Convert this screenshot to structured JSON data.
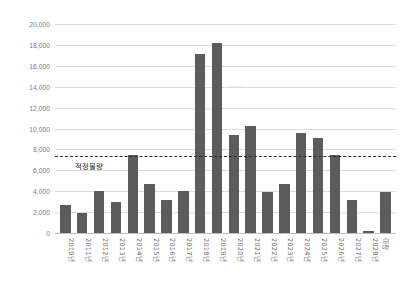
{
  "chart_data": {
    "type": "bar",
    "title": "",
    "subtitle": "",
    "xlabel": "",
    "ylabel": "",
    "ylim": [
      0,
      20000
    ],
    "ytick_step": 2000,
    "yticks": [
      "0",
      "2,000",
      "4,000",
      "6,000",
      "8,000",
      "10,000",
      "12,000",
      "14,000",
      "16,000",
      "18,000",
      "20,000"
    ],
    "ytick_values": [
      0,
      2000,
      4000,
      6000,
      8000,
      10000,
      12000,
      14000,
      16000,
      18000,
      20000
    ],
    "grid": true,
    "legend": "none",
    "categories": [
      "2010년",
      "2011년",
      "2012년",
      "2013년",
      "2014년",
      "2015년",
      "2016년",
      "2017년",
      "2018년",
      "2019년",
      "2020년",
      "2021년",
      "2022년",
      "2023년",
      "2024년",
      "2025년",
      "2026년",
      "2027년",
      "2028년",
      "미정"
    ],
    "values": [
      2650,
      1900,
      4000,
      2980,
      7450,
      4700,
      3180,
      4020,
      17150,
      18200,
      9400,
      10250,
      3880,
      4720,
      9550,
      9080,
      7430,
      3200,
      210,
      3880
    ],
    "series": [
      {
        "name": "물량",
        "values": [
          2650,
          1900,
          4000,
          2980,
          7450,
          4700,
          3180,
          4020,
          17150,
          18200,
          9400,
          10250,
          3880,
          4720,
          9550,
          9080,
          7430,
          3200,
          210,
          3880
        ]
      }
    ],
    "annotations": [
      {
        "type": "hline",
        "label": "적정물량",
        "value": 7400,
        "style": "dashed"
      }
    ],
    "colors": {
      "bar": "#5c5c5c",
      "gridline": "#dcdcdc",
      "axis": "#bfbfbf",
      "refline": "#2b2b2b",
      "tick_text": "#7a7a7a",
      "background": "#ffffff"
    }
  }
}
